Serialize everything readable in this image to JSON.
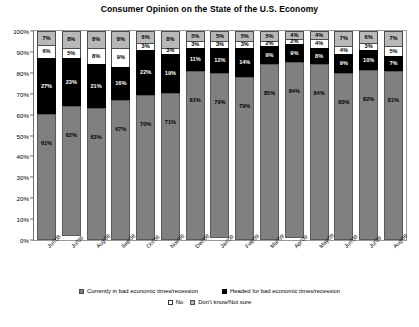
{
  "chart_data": {
    "type": "bar",
    "title": "Consumer Opinion on the State of the U.S. Economy",
    "xlabel": "",
    "ylabel": "",
    "ylim": [
      0,
      100
    ],
    "stacked": true,
    "grid": false,
    "legend_position": "bottom",
    "y_ticks": [
      "0%",
      "10%",
      "20%",
      "30%",
      "40%",
      "50%",
      "60%",
      "70%",
      "80%",
      "90%",
      "100%"
    ],
    "categories": [
      "Jun'08",
      "Jul'08",
      "Aug'08",
      "Sep'08",
      "Oct'08",
      "Nov'08",
      "Dec'08",
      "Jan'09",
      "Feb'09",
      "Mar'09",
      "Apr'09",
      "May'09",
      "Jun'09",
      "Jul'09",
      "Aug'09"
    ],
    "series": [
      {
        "name": "Currently in bad economic times/recession",
        "color": "#808080",
        "values": [
          61,
          62,
          63,
          67,
          70,
          71,
          81,
          79,
          79,
          85,
          84,
          84,
          80,
          82,
          81
        ],
        "labels": [
          "61%",
          "62%",
          "63%",
          "67%",
          "70%",
          "71%",
          "81%",
          "79%",
          "79%",
          "85%",
          "84%",
          "84%",
          "80%",
          "82%",
          "81%"
        ]
      },
      {
        "name": "Headed for bad economic times/recession",
        "color": "#000000",
        "values": [
          27,
          23,
          21,
          16,
          22,
          19,
          11,
          12,
          14,
          9,
          9,
          8,
          9,
          10,
          7
        ],
        "labels": [
          "27%",
          "23%",
          "21%",
          "16%",
          "22%",
          "19%",
          "11%",
          "12%",
          "14%",
          "9%",
          "9%",
          "8%",
          "9%",
          "10%",
          "7%"
        ]
      },
      {
        "name": "No",
        "color": "#ffffff",
        "values": [
          6,
          5,
          8,
          9,
          3,
          3,
          3,
          3,
          3,
          2,
          2,
          4,
          4,
          3,
          5
        ],
        "labels": [
          "6%",
          "5%",
          "8%",
          "9%",
          "3%",
          "3%",
          "3%",
          "3%",
          "3%",
          "2%",
          "2%",
          "4%",
          "4%",
          "3%",
          "5%"
        ]
      },
      {
        "name": "Don't know/Not sure",
        "color": "#b8b8b8",
        "values": [
          7,
          8,
          8,
          8,
          6,
          8,
          5,
          5,
          5,
          5,
          4,
          4,
          7,
          6,
          7
        ],
        "labels": [
          "7%",
          "8%",
          "8%",
          "8%",
          "6%",
          "8%",
          "5%",
          "5%",
          "5%",
          "5%",
          "4%",
          "4%",
          "7%",
          "6%",
          "7%"
        ]
      }
    ],
    "legend": [
      "Currently in bad economic times/recession",
      "Headed for bad economic times/recession",
      "No",
      "Don't know/Not sure"
    ]
  }
}
